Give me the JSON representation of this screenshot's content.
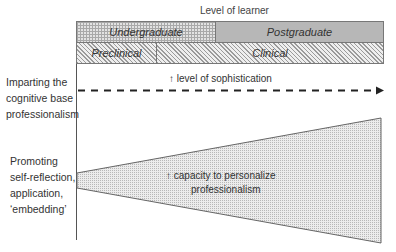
{
  "header": {
    "title": "Level of learner"
  },
  "bars": {
    "row1": [
      {
        "label": "Undergraduate",
        "pattern": "grid"
      },
      {
        "label": "Postgraduate",
        "pattern": "dots"
      }
    ],
    "row2": [
      {
        "label": "Preclinical",
        "pattern": "hatch"
      },
      {
        "label": "Clinical",
        "pattern": "hatch"
      }
    ]
  },
  "rows": [
    {
      "label_lines": [
        "Imparting the",
        "cognitive base",
        "professionalism"
      ],
      "shape": "dashed-arrow",
      "annotation": {
        "arrow": "↑",
        "text": "level of sophistication"
      }
    },
    {
      "label_lines": [
        "Promoting",
        "self-reflection,",
        "application,",
        "‘embedding’"
      ],
      "shape": "widening-wedge",
      "annotation": {
        "arrow": "↑",
        "text_lines": [
          "capacity to personalize",
          "professionalism"
        ]
      }
    }
  ],
  "colors": {
    "line": "#333333",
    "border": "#777777",
    "fill": "#e2e2e2"
  }
}
